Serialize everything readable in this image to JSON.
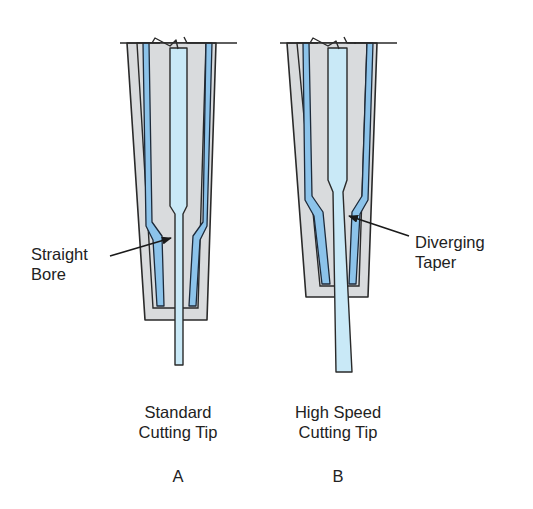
{
  "figure": {
    "tips": [
      {
        "id": "A",
        "name_line1": "Standard",
        "name_line2": "Cutting Tip",
        "letter": "A",
        "callout_line1": "Straight",
        "callout_line2": "Bore"
      },
      {
        "id": "B",
        "name_line1": "High Speed",
        "name_line2": "Cutting Tip",
        "letter": "B",
        "callout_line1": "Diverging",
        "callout_line2": "Taper"
      }
    ],
    "colors": {
      "body_gray": "#d9dbdd",
      "gas_channel_blue": "#8cc3ea",
      "bore_light_blue": "#c9e9f7",
      "outline": "#2a2a2a",
      "text": "#222222"
    }
  }
}
